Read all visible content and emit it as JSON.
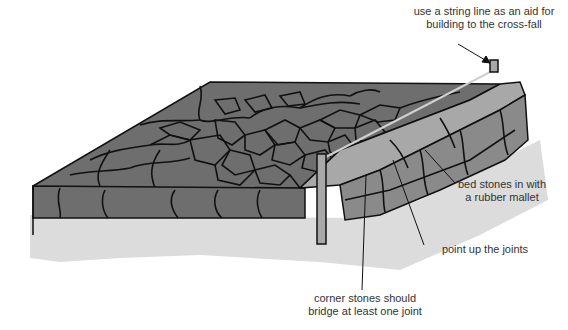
{
  "figure": {
    "colors": {
      "background": "#ffffff",
      "stone_dark": "#6e6e6e",
      "stone_top": "#7a7a7a",
      "kerb_light": "#a8a8a8",
      "kerb_side": "#8a8a8a",
      "shadow": "#dcdcdc",
      "outline": "#111111",
      "string_line": "#c8c8c8",
      "label_text": "#333333"
    }
  },
  "labels": {
    "string_line": {
      "line1": "use a string line as an aid for",
      "line2": "building to the cross-fall"
    },
    "bed_stones": {
      "line1": "bed stones in with",
      "line2": "a rubber mallet"
    },
    "point_joints": {
      "line1": "point up the joints"
    },
    "corner_stones": {
      "line1": "corner stones should",
      "line2": "bridge at least one joint"
    }
  }
}
